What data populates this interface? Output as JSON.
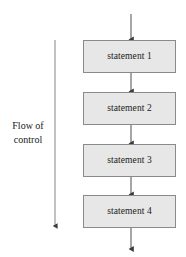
{
  "diagram": {
    "type": "flowchart-sequence",
    "background_color": "#ffffff",
    "node_fill_color": "#e7e7e7",
    "node_border_color": "#8a8a8a",
    "line_color": "#595959",
    "text_color": "#1a1a1a",
    "nodes": [
      {
        "id": "stmt1",
        "label": "statement 1",
        "x": 83,
        "y": 40,
        "width": 93,
        "height": 33
      },
      {
        "id": "stmt2",
        "label": "statement 2",
        "x": 83,
        "y": 92,
        "width": 93,
        "height": 33
      },
      {
        "id": "stmt3",
        "label": "statement 3",
        "x": 83,
        "y": 144,
        "width": 93,
        "height": 33
      },
      {
        "id": "stmt4",
        "label": "statement 4",
        "x": 83,
        "y": 195,
        "width": 93,
        "height": 33
      }
    ],
    "connectors": [
      {
        "id": "entry-arrow",
        "from": "start",
        "to": "stmt1",
        "x": 131,
        "y1": 14,
        "y2": 40
      },
      {
        "id": "stmt1-to-stmt2",
        "from": "stmt1",
        "to": "stmt2",
        "x": 131,
        "y1": 73,
        "y2": 92
      },
      {
        "id": "stmt2-to-stmt3",
        "from": "stmt2",
        "to": "stmt3",
        "x": 131,
        "y1": 125,
        "y2": 144
      },
      {
        "id": "stmt3-to-stmt4",
        "from": "stmt3",
        "to": "stmt4",
        "x": 131,
        "y1": 177,
        "y2": 195
      },
      {
        "id": "exit-arrow",
        "from": "stmt4",
        "to": "end",
        "x": 131,
        "y1": 228,
        "y2": 250
      }
    ],
    "flow_arrow": {
      "id": "flow-of-control-arrow",
      "x": 55,
      "y1": 40,
      "y2": 227,
      "direction": "down"
    },
    "flow_caption": {
      "line1": "Flow of",
      "line2": "control",
      "x": 4,
      "y": 119,
      "width": 48
    }
  }
}
